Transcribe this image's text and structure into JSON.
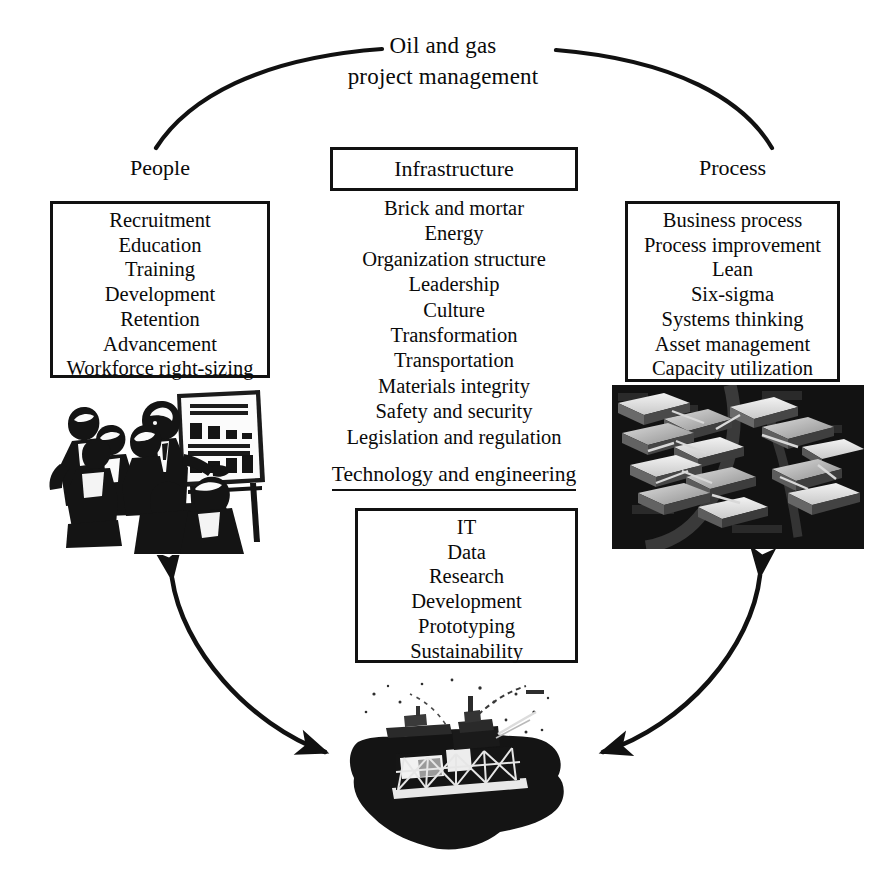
{
  "title": {
    "line1": "Oil and gas",
    "line2": "project management"
  },
  "pillars": {
    "people": {
      "label": "People",
      "items": [
        "Recruitment",
        "Education",
        "Training",
        "Development",
        "Retention",
        "Advancement",
        "Workforce right-sizing"
      ],
      "image": {
        "name": "people-training-presentation-illustration",
        "flipchart_labels": [
          "BEFORE",
          "AFTER"
        ]
      }
    },
    "infrastructure": {
      "label": "Infrastructure",
      "items": [
        "Brick and mortar",
        "Energy",
        "Organization structure",
        "Leadership",
        "Culture",
        "Transformation",
        "Transportation",
        "Materials integrity",
        "Safety and security",
        "Legislation and regulation"
      ]
    },
    "technology": {
      "label": "Technology and engineering",
      "items": [
        "IT",
        "Data",
        "Research",
        "Development",
        "Prototyping",
        "Sustainability"
      ]
    },
    "process": {
      "label": "Process",
      "items": [
        "Business process",
        "Process improvement",
        "Lean",
        "Six-sigma",
        "Systems thinking",
        "Asset management",
        "Capacity utilization"
      ],
      "image": {
        "name": "industrial-facility-aerial-photo"
      }
    }
  },
  "center_image": {
    "name": "offshore-oil-platform-photo"
  },
  "connectors": {
    "top_arc": "arc linking People, Oil and gas project management, and Process",
    "left_arrow": "double-headed curved arrow between People and the offshore platform",
    "right_arrow": "double-headed curved arrow between Process and the offshore platform"
  },
  "colors": {
    "ink": "#111111",
    "page": "#ffffff"
  }
}
